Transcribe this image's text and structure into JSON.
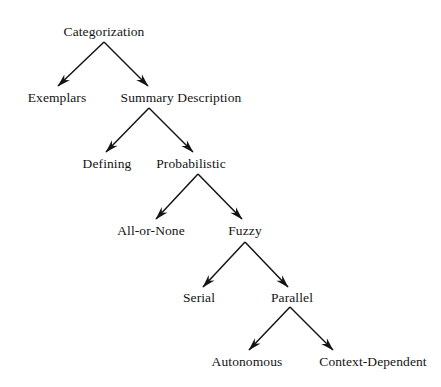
{
  "diagram": {
    "type": "tree",
    "orientation": "top-down",
    "background_color": "#ffffff",
    "line_color": "#141414",
    "text_color": "#141414",
    "arrowhead": "barbed-open",
    "nodes": [
      {
        "id": "categorization",
        "label": "Categorization",
        "level": 0,
        "cx": 104,
        "baseline_y": 37
      },
      {
        "id": "exemplars",
        "label": "Exemplars",
        "level": 1,
        "cx": 57,
        "baseline_y": 103
      },
      {
        "id": "summary-description",
        "label": "Summary Description",
        "level": 1,
        "cx": 181,
        "baseline_y": 103
      },
      {
        "id": "defining",
        "label": "Defining",
        "level": 2,
        "cx": 107,
        "baseline_y": 169
      },
      {
        "id": "probabilistic",
        "label": "Probabilistic",
        "level": 2,
        "cx": 191,
        "baseline_y": 169
      },
      {
        "id": "all-or-none",
        "label": "All-or-None",
        "level": 3,
        "cx": 151,
        "baseline_y": 236
      },
      {
        "id": "fuzzy",
        "label": "Fuzzy",
        "level": 3,
        "cx": 245,
        "baseline_y": 236
      },
      {
        "id": "serial",
        "label": "Serial",
        "level": 4,
        "cx": 199,
        "baseline_y": 303
      },
      {
        "id": "parallel",
        "label": "Parallel",
        "level": 4,
        "cx": 292,
        "baseline_y": 303
      },
      {
        "id": "autonomous",
        "label": "Autonomous",
        "level": 5,
        "cx": 247,
        "baseline_y": 367
      },
      {
        "id": "context-dependent",
        "label": "Context-Dependent",
        "level": 5,
        "cx": 373,
        "baseline_y": 367
      }
    ],
    "edges": [
      {
        "from": "categorization",
        "to": "exemplars",
        "x1": 104,
        "y1": 42,
        "x2": 58,
        "y2": 86
      },
      {
        "from": "categorization",
        "to": "summary-description",
        "x1": 104,
        "y1": 42,
        "x2": 148,
        "y2": 86
      },
      {
        "from": "summary-description",
        "to": "defining",
        "x1": 149,
        "y1": 108,
        "x2": 106,
        "y2": 152
      },
      {
        "from": "summary-description",
        "to": "probabilistic",
        "x1": 149,
        "y1": 108,
        "x2": 193,
        "y2": 152
      },
      {
        "from": "probabilistic",
        "to": "all-or-none",
        "x1": 198,
        "y1": 174,
        "x2": 156,
        "y2": 219
      },
      {
        "from": "probabilistic",
        "to": "fuzzy",
        "x1": 198,
        "y1": 174,
        "x2": 242,
        "y2": 219
      },
      {
        "from": "fuzzy",
        "to": "serial",
        "x1": 245,
        "y1": 242,
        "x2": 203,
        "y2": 287
      },
      {
        "from": "fuzzy",
        "to": "parallel",
        "x1": 245,
        "y1": 242,
        "x2": 288,
        "y2": 287
      },
      {
        "from": "parallel",
        "to": "autonomous",
        "x1": 290,
        "y1": 307,
        "x2": 249,
        "y2": 350
      },
      {
        "from": "parallel",
        "to": "context-dependent",
        "x1": 290,
        "y1": 307,
        "x2": 333,
        "y2": 350
      }
    ]
  }
}
